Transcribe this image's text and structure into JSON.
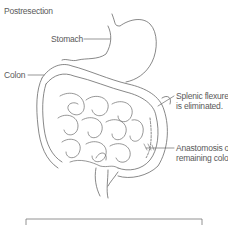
{
  "diagram": {
    "title": "Postresection",
    "labels": {
      "stomach": "Stomach",
      "colon": "Colon",
      "splenic_line1": "Splenic flexure",
      "splenic_line2": "is eliminated.",
      "anastomosis_line1": "Anastomosis of",
      "anastomosis_line2": "remaining colon"
    },
    "colors": {
      "line": "#6a6a6a",
      "text": "#5a5a5a",
      "background": "#ffffff"
    }
  }
}
